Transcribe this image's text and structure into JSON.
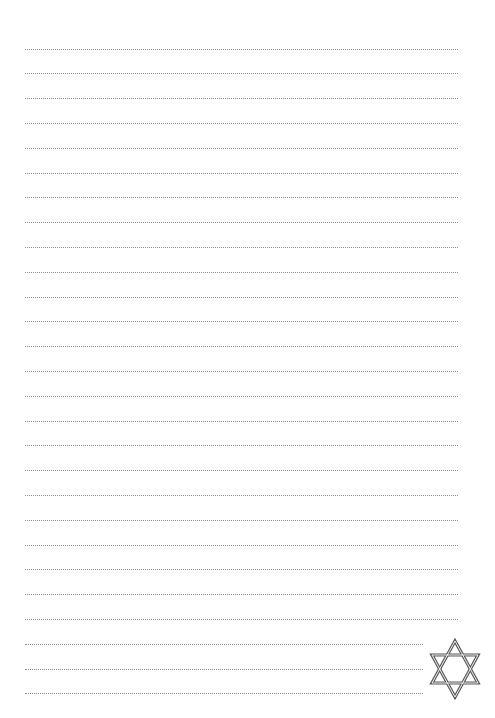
{
  "page": {
    "type": "lined-writing-paper",
    "background": "#ffffff",
    "line_color": "#8a8a8a",
    "line_style": "dotted",
    "line_count": 27,
    "first_line_y": 48.5,
    "line_pitch": 24.8,
    "line_left": 25,
    "line_right_full": 458,
    "line_right_short": 423,
    "short_lines_at_bottom": 3
  },
  "decoration": {
    "icon": "star-of-david-icon",
    "color": "#5a5a5a"
  }
}
